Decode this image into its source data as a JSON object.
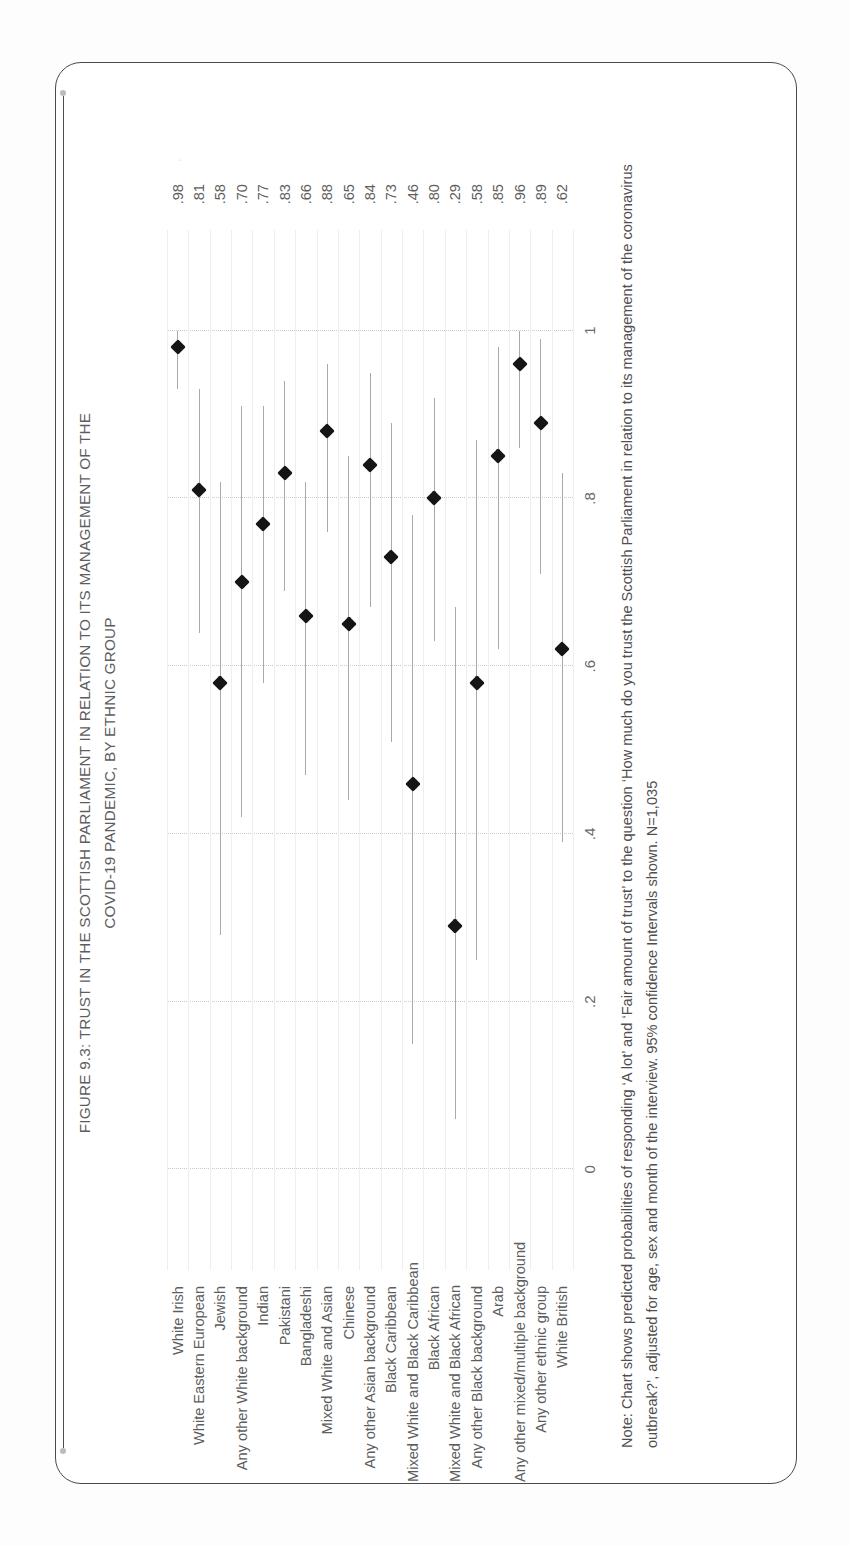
{
  "figure": {
    "title_line1": "FIGURE 9.3: TRUST IN THE SCOTTISH PARLIAMENT IN RELATION TO ITS MANAGEMENT OF THE",
    "title_line2": "COVID-19 PANDEMIC, BY ETHNIC GROUP",
    "note": "Note: Chart shows predicted probabilities of responding ‘A lot’ and ‘Fair amount of trust’ to the question ‘How much do you trust the Scottish Parliament in relation to its management of the coronavirus outbreak?’, adjusted for age, sex and month of the interview. 95% confidence Intervals shown. N=1,035",
    "accent_rule_color": "#4f4f4f",
    "marker_color": "#151515",
    "ci_color": "#a9a9a9",
    "grid_color": "#c9c9c9"
  },
  "chart_data": {
    "type": "scatter",
    "title": "FIGURE 9.3: TRUST IN THE SCOTTISH PARLIAMENT IN RELATION TO ITS MANAGEMENT OF THE COVID-19 PANDEMIC, BY ETHNIC GROUP",
    "subtitle": "",
    "xlabel": "",
    "ylabel": "Predicted probability of trust",
    "orientation": "dot-plot-with-95%-confidence-intervals",
    "value_axis_range": [
      -0.12,
      1.12
    ],
    "tick_labels": [
      "0",
      ".2",
      ".4",
      ".6",
      ".8",
      "1"
    ],
    "tick_values": [
      0,
      0.2,
      0.4,
      0.6,
      0.8,
      1
    ],
    "grid": "dotted-at-ticks",
    "legend": "none",
    "categories": [
      "White Irish",
      "White Eastern European",
      "Jewish",
      "Any other White background",
      "Indian",
      "Pakistani",
      "Bangladeshi",
      "Mixed White and Asian",
      "Chinese",
      "Any other Asian background",
      "Black Caribbean",
      "Mixed White and Black Caribbean",
      "Black African",
      "Mixed White and Black African",
      "Any other Black background",
      "Arab",
      "Any other mixed/multiple background",
      "Any other ethnic group",
      "White British"
    ],
    "values": [
      0.98,
      0.81,
      0.58,
      0.7,
      0.77,
      0.83,
      0.66,
      0.88,
      0.65,
      0.84,
      0.73,
      0.46,
      0.8,
      0.29,
      0.58,
      0.85,
      0.96,
      0.89,
      0.62
    ],
    "value_labels": [
      ".98",
      ".81",
      ".58",
      ".70",
      ".77",
      ".83",
      ".66",
      ".88",
      ".65",
      ".84",
      ".73",
      ".46",
      ".80",
      ".29",
      ".58",
      ".85",
      ".96",
      ".89",
      ".62"
    ],
    "ci_low": [
      0.93,
      0.64,
      0.28,
      0.42,
      0.58,
      0.69,
      0.47,
      0.76,
      0.44,
      0.67,
      0.51,
      0.15,
      0.63,
      0.06,
      0.25,
      0.62,
      0.86,
      0.71,
      0.39
    ],
    "ci_high": [
      1.0,
      0.93,
      0.82,
      0.91,
      0.91,
      0.94,
      0.82,
      0.96,
      0.85,
      0.95,
      0.89,
      0.78,
      0.92,
      0.67,
      0.87,
      0.98,
      1.0,
      0.99,
      0.83
    ]
  }
}
